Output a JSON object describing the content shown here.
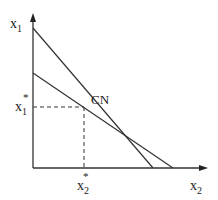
{
  "diagram": {
    "y_axis_label": "x",
    "y_axis_sub": "1",
    "x_axis_label": "x",
    "x_axis_sub": "2",
    "point_label": "CN",
    "y_star_label": "x",
    "y_star_sub": "1",
    "y_star_sup": "*",
    "x_star_label": "x",
    "x_star_sub": "2",
    "x_star_sup": "*",
    "line_color": "#333333",
    "axis_color": "#333333"
  }
}
